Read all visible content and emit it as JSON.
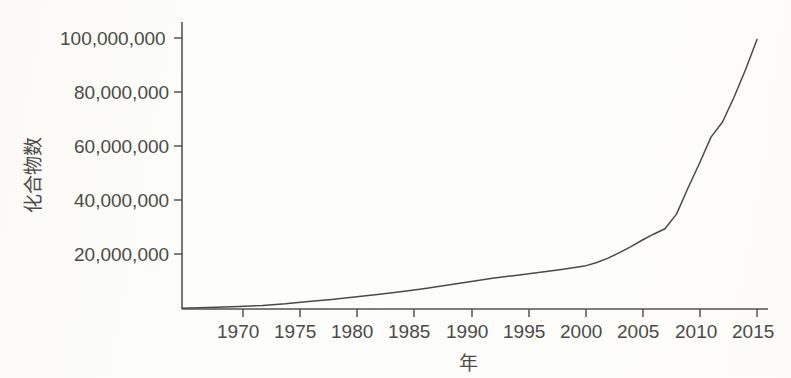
{
  "chart_data": {
    "type": "line",
    "title": "",
    "xlabel": "年",
    "ylabel": "化合物数",
    "xlim": [
      1965,
      2015
    ],
    "ylim": [
      0,
      105000000
    ],
    "grid": false,
    "legend": "none",
    "x_ticks": [
      1970,
      1975,
      1980,
      1985,
      1990,
      1995,
      2000,
      2005,
      2010,
      2015
    ],
    "x_tick_labels": [
      "1970",
      "1975",
      "1980",
      "1985",
      "1990",
      "1995",
      "2000",
      "2005",
      "2010",
      "2015"
    ],
    "y_ticks": [
      20000000,
      40000000,
      60000000,
      80000000,
      100000000
    ],
    "y_tick_labels": [
      "20,000,000",
      "40,000,000",
      "60,000,000",
      "80,000,000",
      "100,000,000"
    ],
    "series": [
      {
        "name": "化合物数",
        "color": "#4a4a46",
        "x": [
          1965,
          1968,
          1970,
          1972,
          1974,
          1976,
          1978,
          1980,
          1982,
          1984,
          1986,
          1988,
          1990,
          1992,
          1994,
          1995,
          1996,
          1998,
          2000,
          2001,
          2002,
          2003,
          2004,
          2005,
          2006,
          2007,
          2008,
          2009,
          2010,
          2011,
          2012,
          2013,
          2014,
          2015
        ],
        "values": [
          300000,
          600000,
          900000,
          1300000,
          1900000,
          2700000,
          3500000,
          4400000,
          5300000,
          6300000,
          7400000,
          8600000,
          9900000,
          11200000,
          12200000,
          12700000,
          13300000,
          14400000,
          15600000,
          16800000,
          18400000,
          20400000,
          22600000,
          25000000,
          27200000,
          29200000,
          34500000,
          44000000,
          53000000,
          62500000,
          68000000,
          77000000,
          87000000,
          98000000
        ]
      }
    ]
  },
  "axes": {
    "y_axis_name": "y-axis",
    "x_axis_name": "x-axis"
  }
}
